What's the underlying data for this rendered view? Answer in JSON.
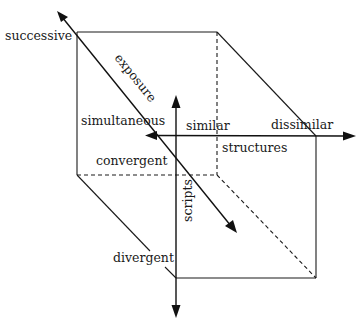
{
  "diagram": {
    "type": "3d-cube-axes",
    "axes": {
      "exposure": {
        "label": "exposure",
        "poles": {
          "start": "successive",
          "end": "simultaneous"
        }
      },
      "structures": {
        "label": "structures",
        "poles": {
          "start": "similar",
          "end": "dissimilar"
        }
      },
      "scripts": {
        "label": "scripts",
        "poles": {
          "start": "convergent",
          "end": "divergent"
        }
      }
    },
    "labels": {
      "successive": "successive",
      "exposure": "exposure",
      "simultaneous": "simultaneous",
      "similar": "similar",
      "dissimilar": "dissimilar",
      "structures": "structures",
      "convergent": "convergent",
      "scripts": "scripts",
      "divergent": "divergent"
    },
    "colors": {
      "line": "#1a1a1a",
      "background": "#ffffff"
    }
  }
}
